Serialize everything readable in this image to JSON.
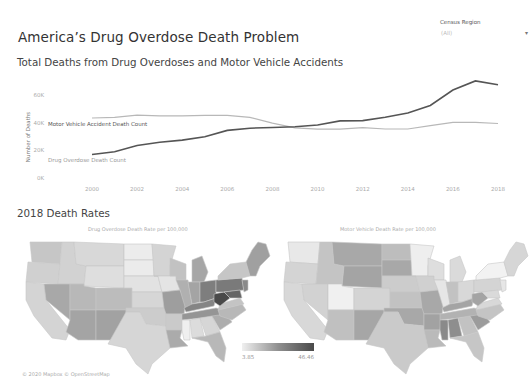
{
  "header": {
    "title": "America’s Drug Overdose Death Problem",
    "subtitle": "Total Deaths from Drug Overdoses and Motor Vehicle Accidents"
  },
  "filter": {
    "label": "Census Region",
    "value": "(All)",
    "caret_icon": "▾"
  },
  "chart_data": [
    {
      "type": "line",
      "title": "Total Deaths from Drug Overdoses and Motor Vehicle Accidents",
      "xlabel": "",
      "ylabel": "Number of Deaths",
      "x": [
        2000,
        2001,
        2002,
        2003,
        2004,
        2005,
        2006,
        2007,
        2008,
        2009,
        2010,
        2011,
        2012,
        2013,
        2014,
        2015,
        2016,
        2017,
        2018
      ],
      "xticks": [
        "2000",
        "2002",
        "2004",
        "2006",
        "2008",
        "2010",
        "2012",
        "2014",
        "2016",
        "2018"
      ],
      "xtick_values": [
        2000,
        2002,
        2004,
        2006,
        2008,
        2010,
        2012,
        2014,
        2016,
        2018
      ],
      "yticks": [
        "0K",
        "20K",
        "40K",
        "60K"
      ],
      "ytick_values": [
        0,
        20000,
        40000,
        60000
      ],
      "ylim": [
        0,
        72000
      ],
      "xlim": [
        1998.5,
        2018.5
      ],
      "grid": false,
      "series": [
        {
          "name": "Motor Vehicle Accident Death Count",
          "label": "Motor Vehicle Accident Death Count",
          "color": "#b8b8b8",
          "values": [
            43400,
            43800,
            45400,
            44900,
            44900,
            45300,
            45300,
            43900,
            39700,
            36300,
            35300,
            35300,
            36400,
            35400,
            35400,
            37800,
            40300,
            40200,
            39400
          ]
        },
        {
          "name": "Drug Overdose Death Count",
          "label": "Drug Overdose Death Count",
          "color": "#555555",
          "values": [
            17000,
            19000,
            23500,
            25800,
            27400,
            29800,
            34400,
            36000,
            36500,
            37000,
            38300,
            41300,
            41500,
            43900,
            47000,
            52400,
            63600,
            70200,
            67400
          ]
        }
      ]
    },
    {
      "type": "heatmap",
      "subtype": "choropleth",
      "title": "Drug Overdose Death Rate per 100,000",
      "legend": {
        "min": "3.85",
        "max": "46.46",
        "placement": "bottom-right"
      },
      "note": "darkest: West Virginia, Ohio, Pennsylvania, Maryland, Delaware, Kentucky, New Hampshire"
    },
    {
      "type": "heatmap",
      "subtype": "choropleth",
      "title": "Motor Vehicle Death Rate per 100,000",
      "note": "darkest: Mississippi, Alabama, South Carolina, Wyoming, New Mexico, Montana"
    }
  ],
  "section2": {
    "title": "2018 Death Rates"
  },
  "maps": {
    "left_title": "Drug Overdose Death Rate per 100,000",
    "right_title": "Motor Vehicle Death Rate per 100,000"
  },
  "legend": {
    "min": "3.85",
    "max": "46.46"
  },
  "attribution": "© 2020 Mapbox © OpenStreetMap"
}
